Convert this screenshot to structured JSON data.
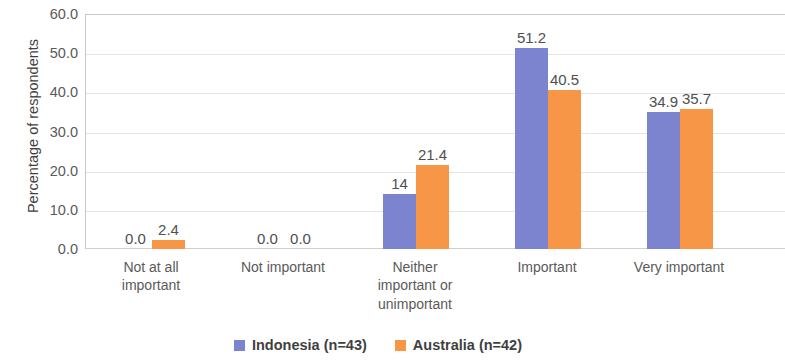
{
  "chart_data": {
    "type": "bar",
    "title": "",
    "xlabel": "",
    "ylabel": "Percentage of respondents",
    "ylim": [
      0,
      60
    ],
    "ytick_labels": [
      "60.0",
      "50.0",
      "40.0",
      "30.0",
      "20.0",
      "10.0",
      "0.0"
    ],
    "ytick_values": [
      60,
      50,
      40,
      30,
      20,
      10,
      0
    ],
    "grid": true,
    "legend_position": "bottom",
    "categories": [
      "Not at all important",
      "Not important",
      "Neither important or unimportant",
      "Important",
      "Very important"
    ],
    "category_lines": [
      [
        "Not at all",
        "important"
      ],
      [
        "Not important"
      ],
      [
        "Neither",
        "important or",
        "unimportant"
      ],
      [
        "Important"
      ],
      [
        "Very important"
      ]
    ],
    "series": [
      {
        "name": "Indonesia (n=43)",
        "color": "#7c83cf",
        "values": [
          0.0,
          0.0,
          14.0,
          51.2,
          34.9
        ],
        "labels": [
          "0.0",
          "0.0",
          "14",
          "51.2",
          "34.9"
        ]
      },
      {
        "name": "Australia (n=42)",
        "color": "#f79646",
        "values": [
          2.4,
          0.0,
          21.4,
          40.5,
          35.7
        ],
        "labels": [
          "2.4",
          "0.0",
          "21.4",
          "40.5",
          "35.7"
        ]
      }
    ]
  },
  "legend": {
    "items": [
      {
        "label": "Indonesia (n=43)",
        "color": "#7c83cf"
      },
      {
        "label": "Australia (n=42)",
        "color": "#f79646"
      }
    ]
  }
}
